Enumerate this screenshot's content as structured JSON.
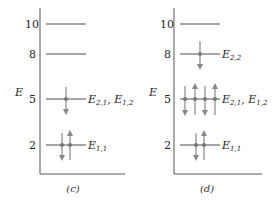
{
  "figure": {
    "axis_label": "E",
    "colors": {
      "axis": "#555555",
      "level": "#888888",
      "arrow": "#888888",
      "dot": "#777777",
      "text": "#222222"
    },
    "panels": [
      {
        "id": "c",
        "caption": "(c)",
        "levels": [
          {
            "value": "10",
            "label_main": "",
            "electrons": []
          },
          {
            "value": "8",
            "label_main": "",
            "electrons": []
          },
          {
            "value": "5",
            "label": "E2,1, E1,2",
            "electrons": [
              "down"
            ]
          },
          {
            "value": "2",
            "label": "E1,1",
            "electrons": [
              "down",
              "up"
            ]
          }
        ]
      },
      {
        "id": "d",
        "caption": "(d)",
        "levels": [
          {
            "value": "10",
            "electrons": []
          },
          {
            "value": "8",
            "label": "E2,2",
            "electrons": [
              "down"
            ]
          },
          {
            "value": "5",
            "label": "E2,1, E1,2",
            "electrons": [
              "down",
              "up",
              "down",
              "up"
            ]
          },
          {
            "value": "2",
            "label": "E1,1",
            "electrons": [
              "down",
              "up"
            ]
          }
        ]
      }
    ]
  }
}
